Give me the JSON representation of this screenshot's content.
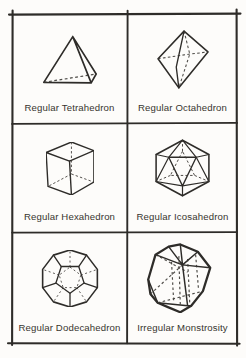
{
  "page": {
    "background_color": "#fdfcfa",
    "ink_color": "#2e2c29",
    "label_color": "#38352f",
    "layout": "2x3 hand-drawn table of polyhedra"
  },
  "cells": [
    {
      "label": "Regular Tetrahedron",
      "figure_icon": "tetrahedron-icon"
    },
    {
      "label": "Regular Octahedron",
      "figure_icon": "octahedron-icon"
    },
    {
      "label": "Regular Hexahedron",
      "figure_icon": "hexahedron-icon"
    },
    {
      "label": "Regular Icosahedron",
      "figure_icon": "icosahedron-icon"
    },
    {
      "label": "Regular Dodecahedron",
      "figure_icon": "dodecahedron-icon"
    },
    {
      "label": "Irregular Monstrosity",
      "figure_icon": "irregular-monstrosity-icon"
    }
  ]
}
